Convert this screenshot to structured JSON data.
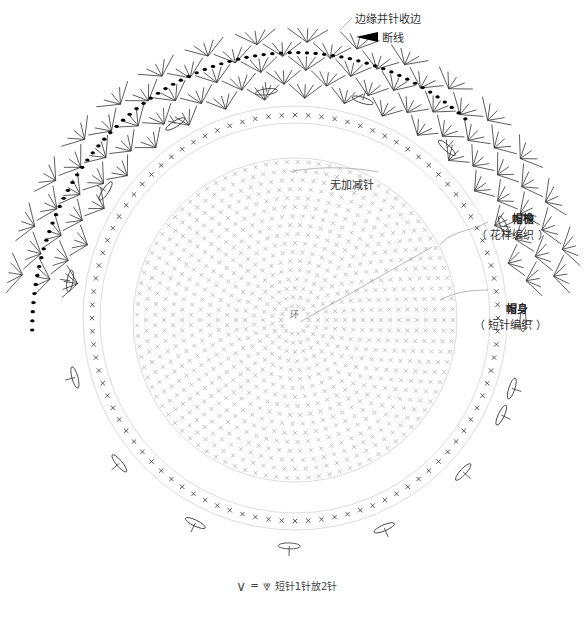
{
  "labels": {
    "edge_finish": "边缘并针收边",
    "cut_yarn": "断线",
    "no_increase": "无加减针",
    "brim_title": "帽檐",
    "brim_sub": "（ 花样编织 ）",
    "crown_title": "帽身",
    "crown_sub": "（ 短针编织 ）"
  },
  "legend": {
    "symbol_left": "∨",
    "equals": "=",
    "symbol_right": "⩔",
    "text": "短针1针放2针"
  },
  "round_markers": [
    "⑤",
    "⑩",
    "⑮",
    "⑳",
    "㉕",
    "㉚"
  ],
  "center_label": "环",
  "colors": {
    "ink": "#222222",
    "light_ink": "#999999",
    "guide": "#cccccc",
    "background": "#ffffff"
  }
}
